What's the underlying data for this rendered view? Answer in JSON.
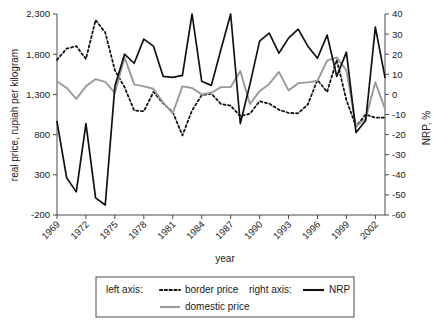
{
  "chart_data": {
    "type": "line",
    "title": "",
    "xlabel": "year",
    "ylabel": "real price, rupiah per kilogram",
    "y2label": "NRP, %",
    "grid": false,
    "legend_position": "bottom",
    "xlim": [
      1969,
      2003
    ],
    "ylim": [
      -200,
      2300
    ],
    "y2lim": [
      -60,
      40
    ],
    "yticks": [
      "-200",
      "300",
      "800",
      "1,300",
      "1,800",
      "2,300"
    ],
    "ytick_values": [
      -200,
      300,
      800,
      1300,
      1800,
      2300
    ],
    "y2ticks": [
      "-60",
      "-50",
      "-40",
      "-30",
      "-20",
      "-10",
      "0",
      "10",
      "20",
      "30",
      "40"
    ],
    "y2tick_values": [
      -60,
      -50,
      -40,
      -30,
      -20,
      -10,
      0,
      10,
      20,
      30,
      40
    ],
    "xticks": [
      "1969",
      "1972",
      "1975",
      "1978",
      "1981",
      "1984",
      "1987",
      "1990",
      "1993",
      "1996",
      "1999",
      "2002"
    ],
    "xtick_values": [
      1969,
      1972,
      1975,
      1978,
      1981,
      1984,
      1987,
      1990,
      1993,
      1996,
      1999,
      2002
    ],
    "x": [
      1969,
      1970,
      1971,
      1972,
      1973,
      1974,
      1975,
      1976,
      1977,
      1978,
      1979,
      1980,
      1981,
      1982,
      1983,
      1984,
      1985,
      1986,
      1987,
      1988,
      1989,
      1990,
      1991,
      1992,
      1993,
      1994,
      1995,
      1996,
      1997,
      1998,
      1999,
      2000,
      2001,
      2002,
      2003
    ],
    "series": [
      {
        "name": "border price",
        "axis": "left",
        "style": "dotted",
        "color": "#121212",
        "values": [
          1730,
          1870,
          1900,
          1740,
          2225,
          2070,
          1600,
          1390,
          1100,
          1090,
          1330,
          1190,
          1080,
          790,
          1100,
          1290,
          1310,
          1180,
          1160,
          1030,
          1060,
          1215,
          1185,
          1110,
          1070,
          1065,
          1175,
          1480,
          1330,
          1730,
          1230,
          900,
          1050,
          1010,
          1010
        ]
      },
      {
        "name": "domestic price",
        "axis": "left",
        "style": "solid",
        "color": "#9a9a9a",
        "values": [
          1460,
          1380,
          1245,
          1400,
          1490,
          1455,
          1320,
          1760,
          1425,
          1400,
          1370,
          1200,
          1065,
          1400,
          1380,
          1300,
          1320,
          1390,
          1390,
          1590,
          1180,
          1340,
          1430,
          1580,
          1350,
          1440,
          1450,
          1470,
          1720,
          1760,
          1600,
          900,
          1000,
          1450,
          1120
        ]
      },
      {
        "name": "NRP",
        "axis": "right",
        "style": "solid",
        "color": "#111111",
        "values": [
          -13.5,
          -41.5,
          -48.5,
          -14.5,
          -51.5,
          -55.0,
          4.0,
          20.0,
          15.5,
          27.5,
          24.0,
          9.0,
          8.5,
          9.5,
          40.0,
          6.5,
          4.5,
          22.5,
          40.0,
          -14.5,
          5.0,
          26.5,
          30.5,
          20.5,
          28.0,
          32.5,
          24.0,
          18.0,
          29.5,
          9.0,
          21.0,
          -19.0,
          -13.0,
          33.5,
          8.5
        ]
      }
    ]
  },
  "axes": {
    "left_title": "real price, rupiah per kilogram",
    "right_title": "NRP, %",
    "x_title": "year"
  },
  "legend": {
    "left_axis_label": "left axis:",
    "right_axis_label": "right axis:",
    "entries": [
      {
        "label": "border price",
        "style": "dotted",
        "color": "#121212"
      },
      {
        "label": "domestic price",
        "style": "solid",
        "color": "#9a9a9a"
      },
      {
        "label": "NRP",
        "style": "solid",
        "color": "#111111"
      }
    ]
  }
}
